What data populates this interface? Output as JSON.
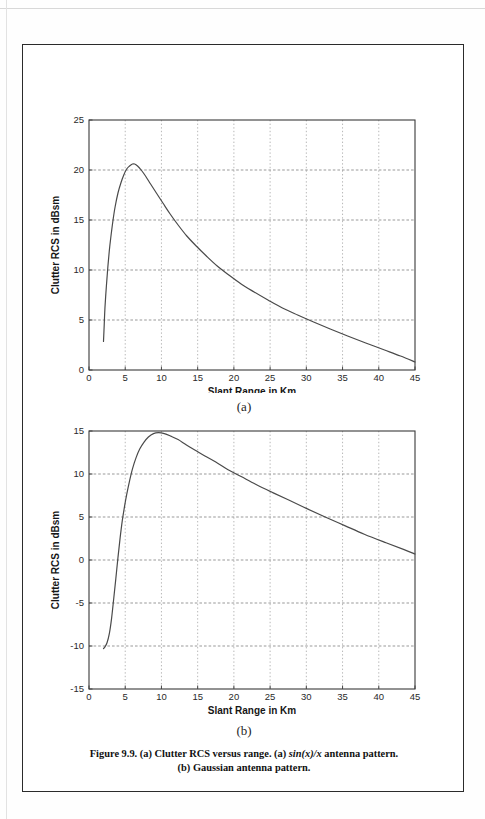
{
  "page": {
    "background_color": "#ffffff",
    "frame_color": "#2b2b2b"
  },
  "caption": {
    "line1_part1": "Figure 9.9. (a) Clutter RCS versus range. (a) ",
    "line1_italic": "sin(x)/x",
    "line1_part2": " antenna pattern.",
    "line2": "(b) Gaussian antenna pattern."
  },
  "sub_labels": {
    "a": "(a)",
    "b": "(b)"
  },
  "chart_data": [
    {
      "id": "chart-a",
      "type": "line",
      "title": "",
      "subtitle": "(a)",
      "xlabel": "Slant Range in Km",
      "ylabel": "Clutter RCS in dBsm",
      "xlim": [
        0,
        45
      ],
      "ylim": [
        0,
        25
      ],
      "xticks": [
        0,
        5,
        10,
        15,
        20,
        25,
        30,
        35,
        40,
        45
      ],
      "yticks": [
        0,
        5,
        10,
        15,
        20,
        25
      ],
      "xtick_labels": [
        "0",
        "5",
        "10",
        "15",
        "20",
        "25",
        "30",
        "35",
        "40",
        "45"
      ],
      "ytick_labels": [
        "0",
        "5",
        "10",
        "15",
        "20",
        "25"
      ],
      "grid": true,
      "grid_style": "dotted",
      "legend": null,
      "line_color": "#4a4a4a",
      "line_width": 1.2,
      "series": [
        {
          "name": "sin(x)/x antenna pattern",
          "x": [
            2.0,
            2.1,
            2.2,
            2.4,
            2.6,
            2.8,
            3.0,
            3.3,
            3.6,
            4.0,
            4.4,
            4.8,
            5.2,
            5.6,
            6.0,
            6.3,
            6.7,
            7.2,
            7.8,
            8.5,
            9.3,
            10.2,
            11.2,
            12.3,
            13.5,
            14.8,
            16.2,
            17.7,
            19.3,
            21.0,
            22.8,
            24.7,
            26.7,
            28.8,
            31.0,
            33.3,
            35.7,
            38.2,
            40.8,
            43.0,
            45.0
          ],
          "y": [
            2.85,
            4.5,
            6.2,
            8.4,
            10.3,
            11.9,
            13.2,
            14.9,
            16.3,
            17.7,
            18.7,
            19.5,
            20.1,
            20.4,
            20.6,
            20.6,
            20.4,
            20.0,
            19.4,
            18.6,
            17.7,
            16.7,
            15.6,
            14.5,
            13.4,
            12.4,
            11.4,
            10.4,
            9.5,
            8.6,
            7.8,
            7.0,
            6.2,
            5.5,
            4.8,
            4.1,
            3.4,
            2.7,
            2.0,
            1.4,
            0.8
          ]
        }
      ],
      "annotations": {
        "peak_value": 20.6,
        "peak_at_x": 6.2,
        "start_value": 2.85,
        "end_value": 0.8
      }
    },
    {
      "id": "chart-b",
      "type": "line",
      "title": "",
      "subtitle": "(b)",
      "xlabel": "Slant Range in Km",
      "ylabel": "Clutter RCS in dBsm",
      "xlim": [
        0,
        45
      ],
      "ylim": [
        -15,
        15
      ],
      "xticks": [
        0,
        5,
        10,
        15,
        20,
        25,
        30,
        35,
        40,
        45
      ],
      "yticks": [
        -15,
        -10,
        -5,
        0,
        5,
        10,
        15
      ],
      "xtick_labels": [
        "0",
        "5",
        "10",
        "15",
        "20",
        "25",
        "30",
        "35",
        "40",
        "45"
      ],
      "ytick_labels": [
        "-15",
        "-10",
        "-5",
        "0",
        "5",
        "10",
        "15"
      ],
      "grid": true,
      "grid_style": "dotted",
      "legend": null,
      "line_color": "#4a4a4a",
      "line_width": 1.2,
      "series": [
        {
          "name": "Gaussian antenna pattern",
          "x": [
            2.0,
            2.2,
            2.5,
            2.8,
            3.1,
            3.4,
            3.7,
            4.0,
            4.3,
            4.6,
            4.9,
            5.2,
            5.6,
            6.0,
            6.5,
            7.0,
            7.6,
            8.2,
            8.9,
            9.6,
            10.4,
            11.3,
            12.3,
            13.4,
            14.6,
            16.0,
            17.5,
            19.2,
            21.0,
            23.0,
            25.2,
            27.5,
            30.0,
            32.6,
            35.3,
            38.0,
            41.0,
            43.5,
            45.0
          ],
          "y": [
            -10.3,
            -10.1,
            -9.6,
            -8.6,
            -6.9,
            -4.6,
            -2.2,
            0.3,
            2.6,
            4.6,
            6.2,
            7.6,
            9.2,
            10.6,
            11.9,
            12.9,
            13.7,
            14.3,
            14.7,
            14.8,
            14.7,
            14.4,
            14.0,
            13.4,
            12.8,
            12.1,
            11.4,
            10.5,
            9.7,
            8.8,
            7.9,
            7.0,
            6.0,
            5.0,
            4.0,
            3.0,
            2.0,
            1.2,
            0.7
          ]
        }
      ],
      "annotations": {
        "peak_value": 14.8,
        "peak_at_x": 9.6,
        "start_value": -10.3,
        "end_value": 0.7
      }
    }
  ]
}
